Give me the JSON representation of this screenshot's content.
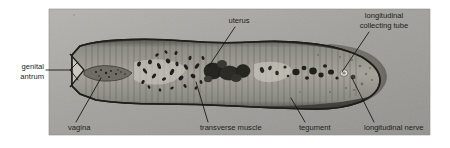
{
  "figure": {
    "kind": "histology-micrograph",
    "photo": {
      "x": 49,
      "y": 9,
      "width": 381,
      "height": 126,
      "background_color": "#9e9e9a",
      "border_color": "#8d8d88"
    },
    "page_background": "#ffffff"
  },
  "labels": [
    {
      "id": "genital-antrum",
      "line1": "genital",
      "line2": "antrum",
      "text_x": 44,
      "text_y1": 69,
      "text_y2": 79,
      "anchor": "end",
      "leader": "M46,70 L70,70 L78,62 M70,70 L78,80",
      "target_x": 78,
      "target_y": 70
    },
    {
      "id": "vagina",
      "line1": "vagina",
      "line2": "",
      "text_x": 68,
      "text_y1": 130,
      "text_y2": 0,
      "anchor": "start",
      "leader": "M76,122 L101,78",
      "target_x": 101,
      "target_y": 78
    },
    {
      "id": "uterus",
      "line1": "uterus",
      "line2": "",
      "text_x": 239,
      "text_y1": 23,
      "text_y2": 0,
      "anchor": "middle",
      "leader": "M235,27 L209,66",
      "target_x": 209,
      "target_y": 66
    },
    {
      "id": "transverse-muscle",
      "line1": "transverse muscle",
      "line2": "",
      "text_x": 200,
      "text_y1": 130,
      "text_y2": 0,
      "anchor": "start",
      "leader": "M208,122 L196,82",
      "target_x": 196,
      "target_y": 82
    },
    {
      "id": "tegument",
      "line1": "tegument",
      "line2": "",
      "text_x": 299,
      "text_y1": 130,
      "text_y2": 0,
      "anchor": "start",
      "leader": "M305,122 L291,98",
      "target_x": 291,
      "target_y": 98
    },
    {
      "id": "longitudinal-collecting-tube",
      "line1": "longitudinal",
      "line2": "collecting tube",
      "text_x": 384,
      "text_y1": 18,
      "text_y2": 28,
      "anchor": "middle",
      "leader": "M369,32 L342,72",
      "target_x": 342,
      "target_y": 72
    },
    {
      "id": "longitudinal-nerve",
      "line1": "longitudinal nerve",
      "line2": "",
      "text_x": 364,
      "text_y1": 130,
      "text_y2": 0,
      "anchor": "start",
      "leader": "M374,122 L352,78",
      "target_x": 352,
      "target_y": 78
    }
  ],
  "specimen": {
    "body_fill": "#8a8982",
    "body_outline": "#2a2a26",
    "interior_fill": "#a8a69c",
    "dark_organ_fill": "#2e2c28",
    "posterior_fill": "#76756e",
    "lumen_fill": "#d8d6cd"
  }
}
